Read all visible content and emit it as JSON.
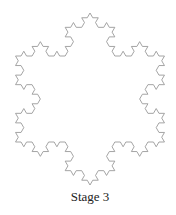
{
  "figure": {
    "type": "koch-snowflake",
    "stage": 3,
    "caption": "Stage 3",
    "line_color": "#9a9a9a",
    "text_color": "#222222"
  }
}
